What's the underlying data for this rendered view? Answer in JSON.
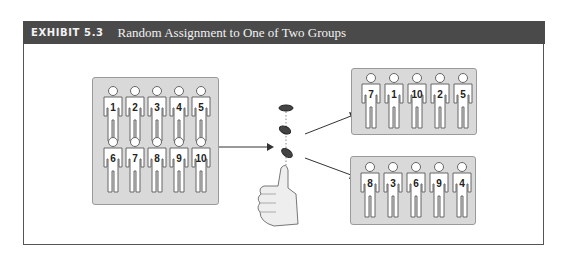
{
  "header": {
    "exhibit_label": "EXHIBIT 5.3",
    "title": "Random Assignment to One of Two Groups"
  },
  "source_group": {
    "label": "Participant pool",
    "members": [
      "1",
      "2",
      "3",
      "4",
      "5",
      "6",
      "7",
      "8",
      "9",
      "10"
    ]
  },
  "randomizer": {
    "icon": "coin-flip-thumb-icon",
    "coins": 3
  },
  "group_a": {
    "members": [
      "7",
      "1",
      "10",
      "2",
      "5"
    ]
  },
  "group_b": {
    "members": [
      "8",
      "3",
      "6",
      "9",
      "4"
    ]
  },
  "colors": {
    "header_bg": "#4a4a4a",
    "panel_bg": "#d9d9d9",
    "figure_fill": "#ffffff",
    "figure_stroke": "#666666"
  }
}
